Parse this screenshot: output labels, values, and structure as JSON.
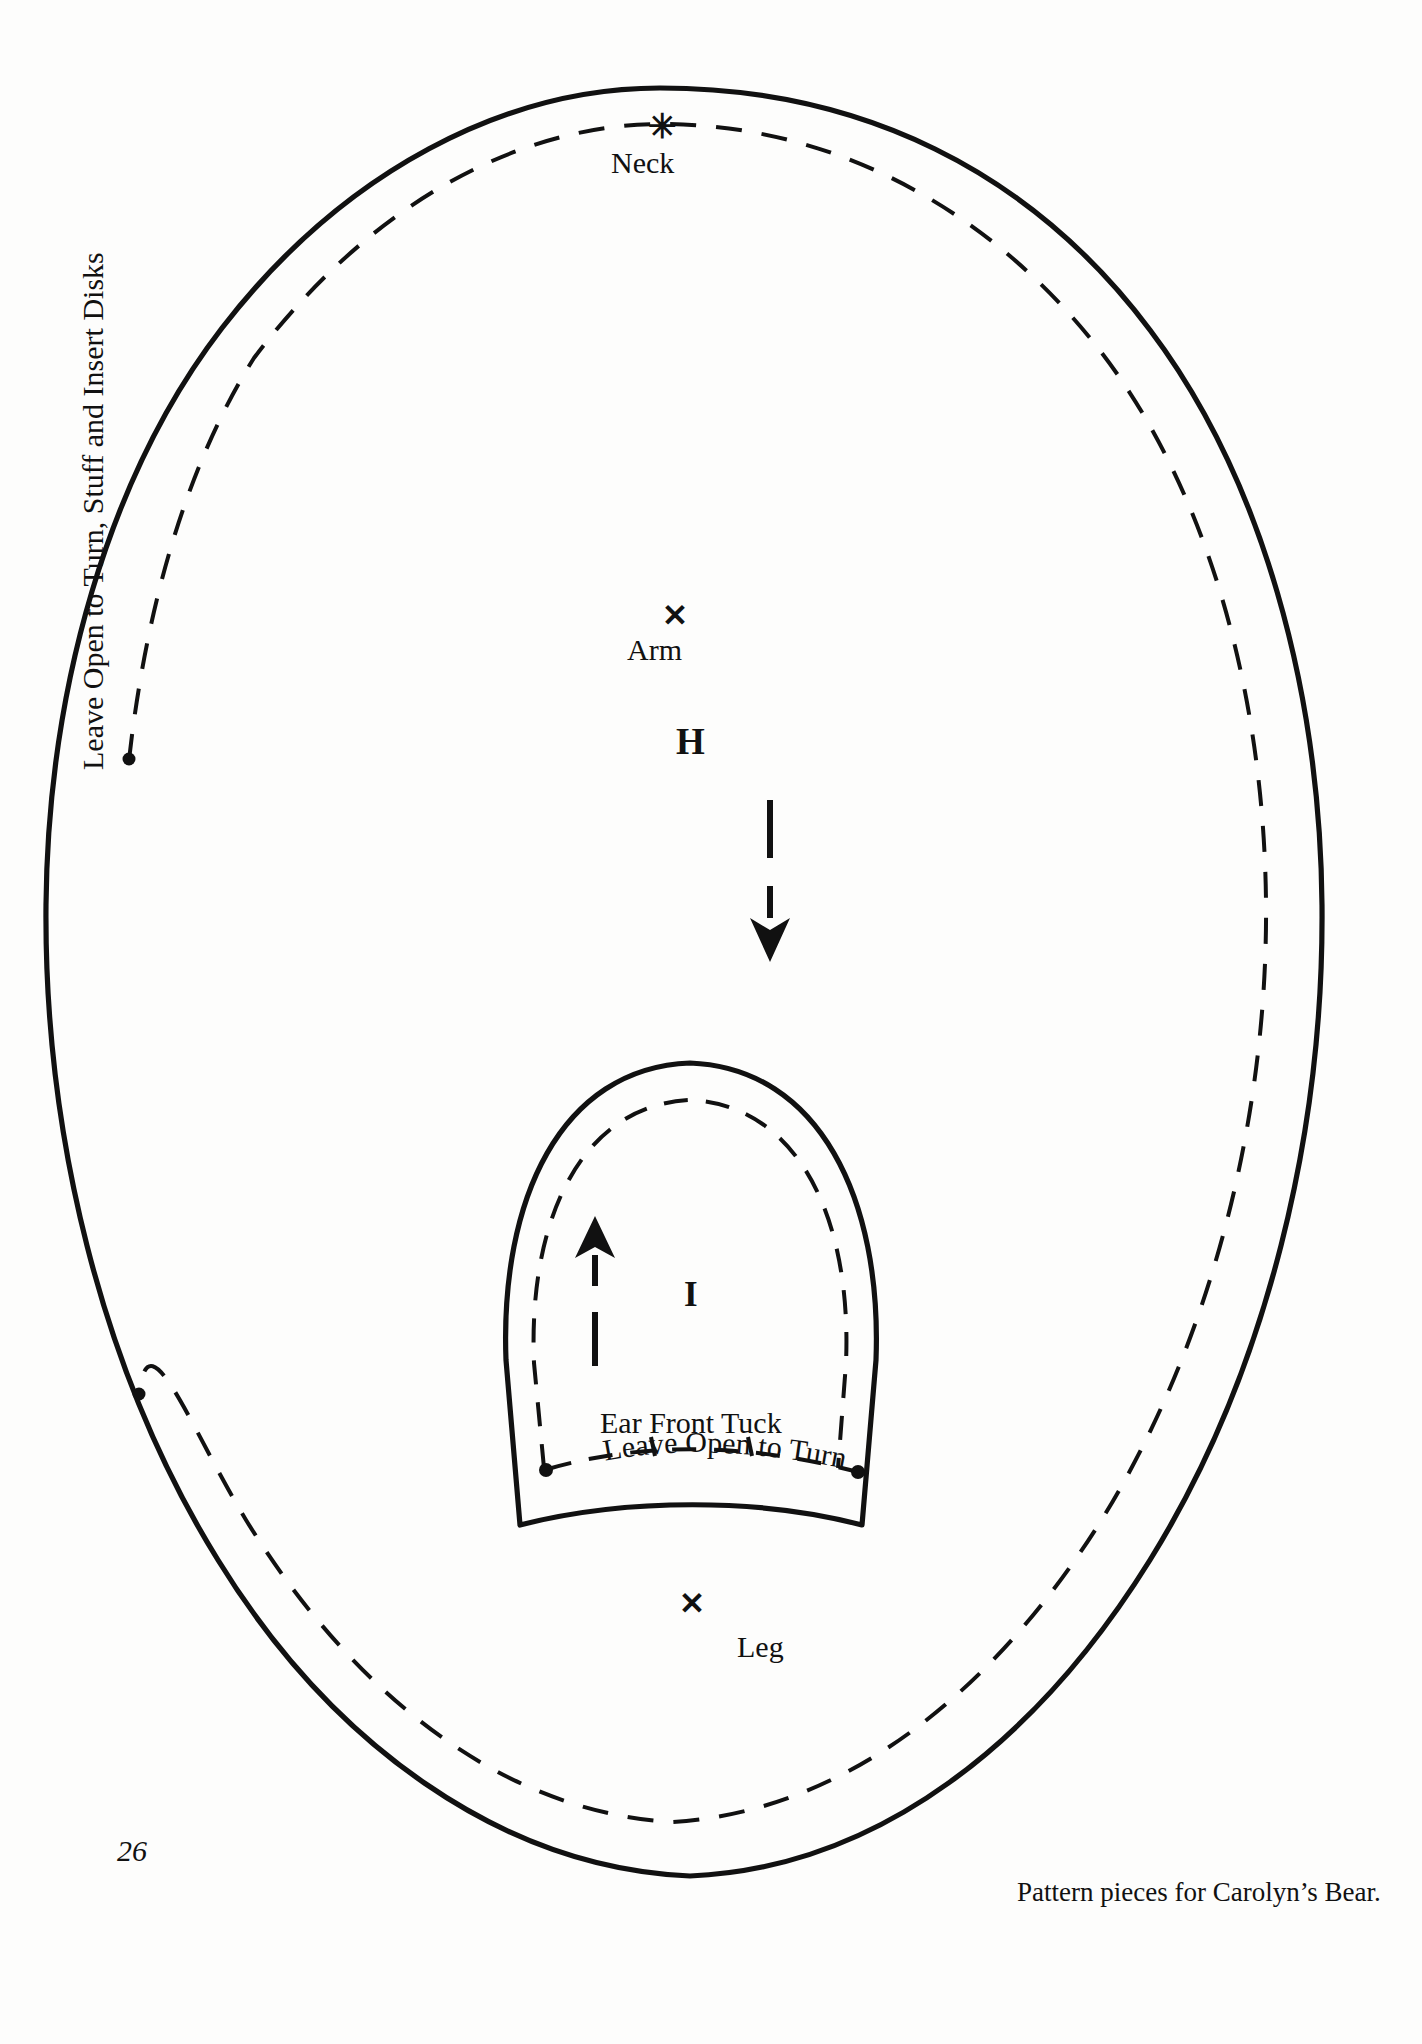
{
  "page": {
    "number": "26",
    "caption": "Pattern pieces for Carolyn’s Bear.",
    "background_color": "#fdfdfc",
    "ink_color": "#111111"
  },
  "pieces": [
    {
      "id": "H",
      "letter": "H",
      "name": "body-piece",
      "labels": [
        "Neck",
        "Arm",
        "Leg"
      ],
      "side_note": "Leave Open to Turn, Stuff and Insert Disks",
      "grain_arrow_direction": "down"
    },
    {
      "id": "I",
      "letter": "I",
      "name": "ear-piece",
      "labels": [
        "Ear Front Tuck",
        "Leave Open to Turn"
      ],
      "grain_arrow_direction": "up"
    }
  ],
  "labels": {
    "neck": "Neck",
    "arm": "Arm",
    "leg": "Leg",
    "piece_h": "H",
    "piece_i": "I",
    "ear_front_tuck": "Ear Front Tuck",
    "leave_open_to_turn": "Leave Open to Turn",
    "side_note": "Leave Open to Turn, Stuff and Insert Disks"
  },
  "marks": {
    "x_glyph": "✕",
    "neck_mark": "✳",
    "dot_color": "#111111"
  },
  "curved_text": {
    "leave_open_to_turn": "Leave Open to Turn"
  }
}
